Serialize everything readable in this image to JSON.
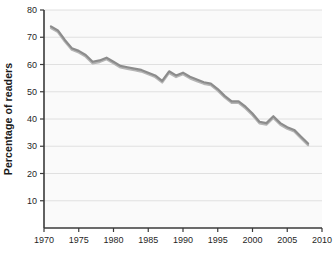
{
  "chart_data": {
    "type": "line",
    "title": "",
    "xlabel": "",
    "ylabel": "Percentage of readers",
    "xlim": [
      1970,
      2010
    ],
    "ylim": [
      0,
      80
    ],
    "xticks": [
      1970,
      1975,
      1980,
      1985,
      1990,
      1995,
      2000,
      2005,
      2010
    ],
    "xtick_labels": [
      "1970",
      "1975",
      "1980",
      "1985",
      "1990",
      "1995",
      "2000",
      "2005",
      "2010"
    ],
    "yticks": [
      10,
      20,
      30,
      40,
      50,
      60,
      70,
      80
    ],
    "ytick_labels": [
      "10",
      "20",
      "30",
      "40",
      "50",
      "60",
      "70",
      "80"
    ],
    "grid": "horizontal",
    "legend": "none",
    "x": [
      1971,
      1972,
      1973,
      1974,
      1975,
      1976,
      1977,
      1978,
      1979,
      1980,
      1981,
      1982,
      1983,
      1984,
      1985,
      1986,
      1987,
      1988,
      1989,
      1990,
      1991,
      1992,
      1993,
      1994,
      1995,
      1996,
      1997,
      1998,
      1999,
      2000,
      2001,
      2002,
      2003,
      2004,
      2005,
      2006,
      2007,
      2008
    ],
    "series": [
      {
        "name": "Percentage of readers",
        "color": "#8c8c8c",
        "values": [
          74.0,
          72.5,
          69.0,
          66.0,
          65.0,
          63.5,
          61.0,
          61.5,
          62.5,
          61.0,
          59.5,
          59.0,
          58.5,
          58.0,
          57.0,
          56.0,
          54.0,
          57.5,
          56.0,
          57.0,
          55.5,
          54.5,
          53.5,
          53.0,
          51.0,
          48.5,
          46.5,
          46.5,
          44.5,
          42.0,
          39.0,
          38.5,
          41.0,
          38.5,
          37.0,
          36.0,
          33.5,
          31.0
        ]
      },
      {
        "name": "Percentage of readers (shadow)",
        "color": "#b5b5b5",
        "values": [
          73.4,
          71.9,
          68.4,
          65.4,
          64.4,
          62.9,
          60.4,
          60.9,
          61.9,
          60.4,
          58.9,
          58.4,
          57.9,
          57.4,
          56.4,
          55.4,
          53.4,
          56.9,
          55.4,
          56.4,
          54.9,
          53.9,
          52.9,
          52.4,
          50.4,
          47.9,
          45.9,
          45.9,
          43.9,
          41.4,
          38.4,
          37.9,
          40.4,
          37.9,
          36.4,
          35.4,
          32.9,
          30.4
        ]
      }
    ],
    "colors": {
      "line_dark": "#8c8c8c",
      "line_light": "#b5b5b5",
      "axis": "#3a3a3a",
      "grid": "#dcdcdc",
      "plot_background": "#fafafa",
      "text": "#1f1f1f"
    }
  }
}
